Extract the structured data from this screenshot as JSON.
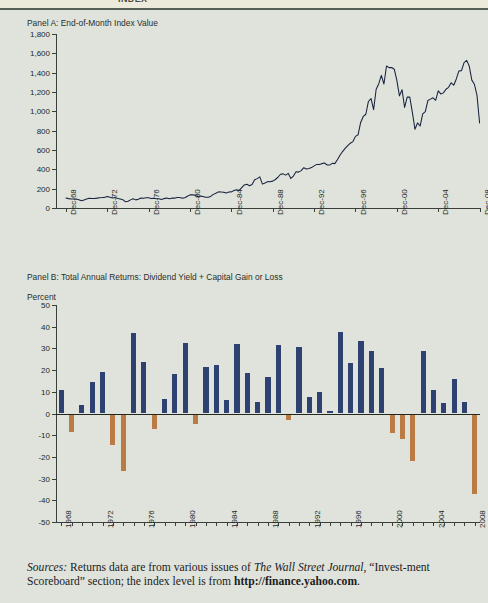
{
  "figure": {
    "cut_off_header": "INDEX",
    "source_note": {
      "label": "Sources:",
      "text_part1": " Returns data are from various issues of ",
      "italic1": "The Wall Street Journal",
      "text_part2": ", “Invest-ment Scoreboard” section; the index level is from ",
      "bold1": "http://finance.yahoo.com",
      "text_part3": "."
    },
    "colors": {
      "background": "#dfe3dc",
      "line": "#17223d",
      "bar_positive": "#2e4272",
      "bar_negative": "#ba7b44",
      "axis": "#3a3f3a"
    }
  },
  "chart_data": [
    {
      "type": "line",
      "panel": "Panel A",
      "title": "Panel A: End-of-Month Index Value",
      "xlabel": "",
      "ylabel": "",
      "ylim": [
        0,
        1800
      ],
      "yticks": [
        "0",
        "200",
        "400",
        "600",
        "800",
        "1,000",
        "1,200",
        "1,400",
        "1,600",
        "1,800"
      ],
      "ytick_values": [
        0,
        200,
        400,
        600,
        800,
        1000,
        1200,
        1400,
        1600,
        1800
      ],
      "xtick_labels": [
        "Dec-68",
        "Dec-72",
        "Dec-76",
        "Dec-80",
        "Dec-84",
        "Dec-88",
        "Dec-92",
        "Dec-96",
        "Dec-00",
        "Dec-04",
        "Dec-08"
      ],
      "xtick_values": [
        1968,
        1972,
        1976,
        1980,
        1984,
        1988,
        1992,
        1996,
        2000,
        2004,
        2008
      ],
      "xlim": [
        1968,
        2009
      ],
      "grid": false,
      "legend": "none",
      "series": [
        {
          "name": "End-of-Month Index Value",
          "x": [
            1968.96,
            1969.21,
            1969.46,
            1969.71,
            1969.96,
            1970.21,
            1970.46,
            1970.71,
            1970.96,
            1971.21,
            1971.46,
            1971.71,
            1971.96,
            1972.21,
            1972.46,
            1972.71,
            1972.96,
            1973.21,
            1973.46,
            1973.71,
            1973.96,
            1974.21,
            1974.46,
            1974.71,
            1974.96,
            1975.21,
            1975.46,
            1975.71,
            1975.96,
            1976.21,
            1976.46,
            1976.71,
            1976.96,
            1977.21,
            1977.46,
            1977.71,
            1977.96,
            1978.21,
            1978.46,
            1978.71,
            1978.96,
            1979.21,
            1979.46,
            1979.71,
            1979.96,
            1980.21,
            1980.46,
            1980.71,
            1980.96,
            1981.21,
            1981.46,
            1981.71,
            1981.96,
            1982.21,
            1982.46,
            1982.71,
            1982.96,
            1983.21,
            1983.46,
            1983.71,
            1983.96,
            1984.21,
            1984.46,
            1984.71,
            1984.96,
            1985.21,
            1985.46,
            1985.71,
            1985.96,
            1986.21,
            1986.46,
            1986.71,
            1986.96,
            1987.21,
            1987.46,
            1987.71,
            1987.96,
            1988.21,
            1988.46,
            1988.71,
            1988.96,
            1989.21,
            1989.46,
            1989.71,
            1989.96,
            1990.21,
            1990.46,
            1990.71,
            1990.96,
            1991.21,
            1991.46,
            1991.71,
            1991.96,
            1992.21,
            1992.46,
            1992.71,
            1992.96,
            1993.21,
            1993.46,
            1993.71,
            1993.96,
            1994.21,
            1994.46,
            1994.71,
            1994.96,
            1995.21,
            1995.46,
            1995.71,
            1995.96,
            1996.21,
            1996.46,
            1996.71,
            1996.96,
            1997.21,
            1997.46,
            1997.71,
            1997.96,
            1998.21,
            1998.46,
            1998.71,
            1998.96,
            1999.21,
            1999.46,
            1999.71,
            1999.96,
            2000.21,
            2000.46,
            2000.71,
            2000.96,
            2001.21,
            2001.46,
            2001.71,
            2001.96,
            2002.21,
            2002.46,
            2002.71,
            2002.96,
            2003.21,
            2003.46,
            2003.71,
            2003.96,
            2004.21,
            2004.46,
            2004.71,
            2004.96,
            2005.21,
            2005.46,
            2005.71,
            2005.96,
            2006.21,
            2006.46,
            2006.71,
            2006.96,
            2007.21,
            2007.46,
            2007.71,
            2007.96,
            2008.21,
            2008.46,
            2008.71,
            2008.96
          ],
          "values": [
            103,
            97,
            94,
            93,
            92,
            86,
            76,
            84,
            92,
            100,
            99,
            98,
            102,
            107,
            108,
            110,
            118,
            112,
            104,
            108,
            98,
            94,
            86,
            64,
            69,
            84,
            95,
            84,
            90,
            103,
            101,
            105,
            107,
            98,
            100,
            96,
            95,
            89,
            97,
            103,
            96,
            102,
            102,
            109,
            108,
            102,
            106,
            122,
            136,
            136,
            133,
            116,
            123,
            120,
            112,
            111,
            120,
            141,
            153,
            167,
            166,
            164,
            154,
            166,
            167,
            181,
            190,
            182,
            211,
            239,
            245,
            231,
            242,
            292,
            304,
            322,
            247,
            259,
            273,
            272,
            278,
            295,
            318,
            349,
            353,
            340,
            358,
            306,
            330,
            375,
            371,
            387,
            417,
            404,
            408,
            418,
            436,
            451,
            450,
            459,
            466,
            445,
            444,
            462,
            459,
            500,
            545,
            584,
            616,
            645,
            670,
            687,
            741,
            757,
            885,
            947,
            970,
            1102,
            1133,
            1017,
            1229,
            1286,
            1372,
            1283,
            1469,
            1452,
            1454,
            1436,
            1320,
            1160,
            1224,
            1040,
            1148,
            1147,
            989,
            815,
            880,
            848,
            974,
            996,
            1112,
            1126,
            1140,
            1114,
            1212,
            1180,
            1191,
            1228,
            1248,
            1295,
            1270,
            1335,
            1418,
            1421,
            1503,
            1527,
            1468,
            1323,
            1280,
            1166,
            880
          ]
        }
      ]
    },
    {
      "type": "bar",
      "panel": "Panel B",
      "title": "Panel B: Total Annual Returns: Dividend Yield + Capital Gain or Loss",
      "ylabel": "Percent",
      "xlabel": "",
      "ylim": [
        -50,
        50
      ],
      "yticks": [
        "50",
        "40",
        "30",
        "20",
        "10",
        "0",
        "-10",
        "-20",
        "-30",
        "-40",
        "-50"
      ],
      "ytick_values": [
        50,
        40,
        30,
        20,
        10,
        0,
        -10,
        -20,
        -30,
        -40,
        -50
      ],
      "xtick_labels": [
        "1968",
        "1972",
        "1976",
        "1980",
        "1984",
        "1988",
        "1992",
        "1996",
        "2000",
        "2004",
        "2008"
      ],
      "xtick_values": [
        1968,
        1972,
        1976,
        1980,
        1984,
        1988,
        1992,
        1996,
        2000,
        2004,
        2008
      ],
      "grid": false,
      "legend": "none",
      "categories": [
        1968,
        1969,
        1970,
        1971,
        1972,
        1973,
        1974,
        1975,
        1976,
        1977,
        1978,
        1979,
        1980,
        1981,
        1982,
        1983,
        1984,
        1985,
        1986,
        1987,
        1988,
        1989,
        1990,
        1991,
        1992,
        1993,
        1994,
        1995,
        1996,
        1997,
        1998,
        1999,
        2000,
        2001,
        2002,
        2003,
        2004,
        2005,
        2006,
        2007,
        2008
      ],
      "values": [
        11.0,
        -8.5,
        4.0,
        14.3,
        19.0,
        -14.7,
        -26.5,
        37.2,
        23.8,
        -7.2,
        6.6,
        18.4,
        32.4,
        -4.9,
        21.4,
        22.5,
        6.3,
        32.2,
        18.5,
        5.2,
        16.8,
        31.5,
        -3.2,
        30.5,
        7.7,
        10.0,
        1.3,
        37.4,
        23.1,
        33.4,
        28.6,
        21.0,
        -9.1,
        -11.9,
        -22.1,
        28.7,
        10.9,
        4.9,
        15.8,
        5.5,
        -37.0
      ]
    }
  ]
}
